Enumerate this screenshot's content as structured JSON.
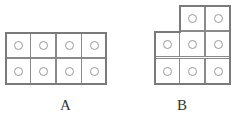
{
  "figures": [
    {
      "id": "A",
      "label": "A",
      "shape": "2 rows x 4 columns rectangle",
      "rows": [
        [
          1,
          1,
          1,
          1
        ],
        [
          1,
          1,
          1,
          1
        ]
      ],
      "cell_count": 8
    },
    {
      "id": "B",
      "label": "B",
      "shape": "3 rows x 3 columns with top-left cell missing",
      "rows": [
        [
          0,
          1,
          1
        ],
        [
          1,
          1,
          1
        ],
        [
          1,
          1,
          1
        ]
      ],
      "cell_count": 8
    }
  ],
  "colors": {
    "line": "#7a7a7a",
    "circle": "#999999",
    "background": "#ffffff"
  }
}
